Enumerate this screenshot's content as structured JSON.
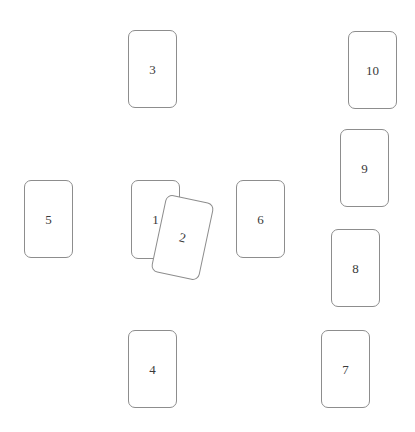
{
  "scene": {
    "title": "Card layout",
    "background_color": "#ffffff",
    "width": 415,
    "height": 432,
    "card": {
      "fill_color": "#ffffff",
      "border_color": "#8d8d8d",
      "border_radius_px": 7,
      "label_color": "#3a3a3a",
      "default_width": 49,
      "default_height": 78
    },
    "cards": [
      {
        "label": "1",
        "name": "card-1",
        "x": 131,
        "y": 180,
        "width": 49,
        "height": 79,
        "rotation_deg": 0,
        "z": 1
      },
      {
        "label": "2",
        "name": "card-2",
        "x": 158,
        "y": 198,
        "width": 49,
        "height": 79,
        "rotation_deg": 12,
        "z": 2
      },
      {
        "label": "3",
        "name": "card-3",
        "x": 128,
        "y": 30,
        "width": 49,
        "height": 78,
        "rotation_deg": 0,
        "z": 0
      },
      {
        "label": "4",
        "name": "card-4",
        "x": 128,
        "y": 330,
        "width": 49,
        "height": 78,
        "rotation_deg": 0,
        "z": 0
      },
      {
        "label": "5",
        "name": "card-5",
        "x": 24,
        "y": 180,
        "width": 49,
        "height": 78,
        "rotation_deg": 0,
        "z": 0
      },
      {
        "label": "6",
        "name": "card-6",
        "x": 236,
        "y": 180,
        "width": 49,
        "height": 78,
        "rotation_deg": 0,
        "z": 0
      },
      {
        "label": "7",
        "name": "card-7",
        "x": 321,
        "y": 330,
        "width": 49,
        "height": 78,
        "rotation_deg": 0,
        "z": 0
      },
      {
        "label": "8",
        "name": "card-8",
        "x": 331,
        "y": 229,
        "width": 49,
        "height": 78,
        "rotation_deg": 0,
        "z": 0
      },
      {
        "label": "9",
        "name": "card-9",
        "x": 340,
        "y": 129,
        "width": 49,
        "height": 78,
        "rotation_deg": 0,
        "z": 0
      },
      {
        "label": "10",
        "name": "card-10",
        "x": 348,
        "y": 31,
        "width": 49,
        "height": 78,
        "rotation_deg": 0,
        "z": 0
      }
    ]
  }
}
